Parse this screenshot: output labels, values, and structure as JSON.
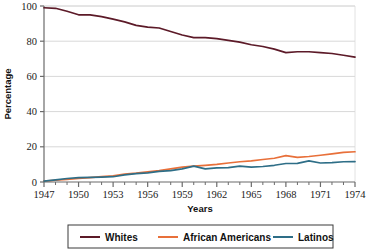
{
  "chart_data": {
    "type": "line",
    "title": "",
    "xlabel": "Years",
    "ylabel": "Percentage",
    "xlim": [
      1947,
      1974
    ],
    "ylim": [
      0,
      100
    ],
    "grid": true,
    "legend_position": "bottom",
    "x_tick_labels": [
      "1947",
      "1950",
      "1953",
      "1956",
      "1959",
      "1962",
      "1965",
      "1968",
      "1971",
      "1974"
    ],
    "x_tick_values": [
      1947,
      1950,
      1953,
      1956,
      1959,
      1962,
      1965,
      1968,
      1971,
      1974
    ],
    "x_minor_ticks": [
      1947,
      1948,
      1949,
      1950,
      1951,
      1952,
      1953,
      1954,
      1955,
      1956,
      1957,
      1958,
      1959,
      1960,
      1961,
      1962,
      1963,
      1964,
      1965,
      1966,
      1967,
      1968,
      1969,
      1970,
      1971,
      1972,
      1973,
      1974
    ],
    "y_tick_labels": [
      "0",
      "20",
      "40",
      "60",
      "80",
      "100"
    ],
    "y_tick_values": [
      0,
      20,
      40,
      60,
      80,
      100
    ],
    "x": [
      1947,
      1948,
      1949,
      1950,
      1951,
      1952,
      1953,
      1954,
      1955,
      1956,
      1957,
      1958,
      1959,
      1960,
      1961,
      1962,
      1963,
      1964,
      1965,
      1966,
      1967,
      1968,
      1969,
      1970,
      1971,
      1972,
      1973,
      1974
    ],
    "series": [
      {
        "name": "Whites",
        "color": "#5C1A28",
        "values": [
          99.0,
          98.7,
          97.0,
          95.0,
          95.0,
          94.0,
          92.5,
          91.0,
          89.0,
          88.0,
          87.5,
          85.5,
          83.5,
          82.0,
          82.0,
          81.5,
          80.5,
          79.5,
          78.0,
          77.0,
          75.5,
          73.5,
          74.0,
          74.0,
          73.5,
          73.0,
          72.0,
          71.0
        ]
      },
      {
        "name": "African Americans",
        "color": "#E8703A",
        "values": [
          0.5,
          1.0,
          1.5,
          2.0,
          2.5,
          3.0,
          3.5,
          4.5,
          5.0,
          5.8,
          6.5,
          7.5,
          8.5,
          9.0,
          9.5,
          10.0,
          10.8,
          11.5,
          12.0,
          12.8,
          13.5,
          15.0,
          14.0,
          14.5,
          15.2,
          16.0,
          16.8,
          17.2
        ]
      },
      {
        "name": "Latinos",
        "color": "#2E6E87",
        "values": [
          0.5,
          1.2,
          2.0,
          2.5,
          2.6,
          2.8,
          3.0,
          4.0,
          4.8,
          5.2,
          6.0,
          6.5,
          7.5,
          9.0,
          7.5,
          8.0,
          8.2,
          9.0,
          8.5,
          8.8,
          9.5,
          10.5,
          10.6,
          12.0,
          10.8,
          11.0,
          11.5,
          11.6
        ]
      }
    ]
  },
  "legend": {
    "entries": [
      {
        "label": "Whites",
        "color": "#5C1A28"
      },
      {
        "label": "African Americans",
        "color": "#E8703A"
      },
      {
        "label": "Latinos",
        "color": "#2E6E87"
      }
    ]
  },
  "axes": {
    "x_title": "Years",
    "y_title": "Percentage"
  },
  "colors": {
    "background": "#ffffff",
    "grid": "#d8d8d8",
    "axis": "#6b6b6b",
    "plot_border": "#e2e2e2",
    "legend_border": "#3a3a3a"
  }
}
